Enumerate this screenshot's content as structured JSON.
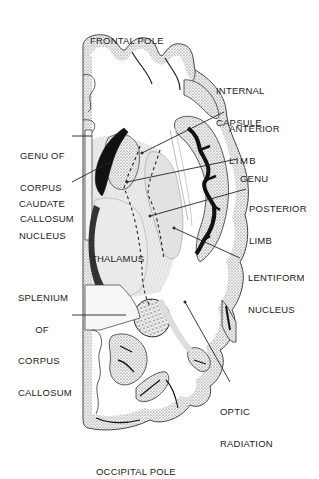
{
  "diagram": {
    "colors": {
      "cortex_fill": "#d9d9d9",
      "ventricle_fill": "#1a1a1a",
      "deep_gray_fill": "#e6e6e6",
      "line": "#222222",
      "background": "#ffffff"
    },
    "labels": {
      "frontal_pole": "FRONTAL POLE",
      "internal_capsule": [
        "INTERNAL",
        "CAPSULE"
      ],
      "anterior_limb": [
        "ANTERIOR",
        "LIMB"
      ],
      "genu_of_corpus_callosum": [
        "GENU OF",
        "CORPUS",
        "CALLOSUM"
      ],
      "genu": "GENU",
      "caudate_nucleus": [
        "CAUDATE",
        "NUCLEUS"
      ],
      "posterior_limb": [
        "POSTERIOR",
        "LIMB"
      ],
      "thalamus": "THALAMUS",
      "lentiform_nucleus": [
        "LENTIFORM",
        "NUCLEUS"
      ],
      "splenium_of_corpus_callosum": [
        "SPLENIUM",
        "OF",
        "CORPUS",
        "CALLOSUM"
      ],
      "optic_radiation": [
        "OPTIC",
        "RADIATION"
      ],
      "occipital_pole": "OCCIPITAL POLE"
    }
  }
}
